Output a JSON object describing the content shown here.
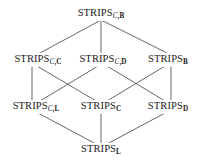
{
  "diagram": {
    "type": "hasse-diagram",
    "background_color": "#ffffff",
    "edge_color": "#555555",
    "text_color": "#1b1b1b",
    "nodes": [
      {
        "id": "c-b",
        "label": "STRIPSC,B",
        "base": "STRIPS",
        "sub_italic": "C",
        "sub_rest": ",B",
        "x": 101,
        "y": 14
      },
      {
        "id": "c-c",
        "label": "STRIPSC,C",
        "base": "STRIPS",
        "sub_italic": "C",
        "sub_rest": ",C",
        "x": 38,
        "y": 60
      },
      {
        "id": "c-d",
        "label": "STRIPSC,D",
        "base": "STRIPS",
        "sub_italic": "C",
        "sub_rest": ",D",
        "x": 103,
        "y": 60
      },
      {
        "id": "b",
        "label": "STRIPSB",
        "base": "STRIPS",
        "sub_italic": "",
        "sub_rest": "B",
        "x": 168,
        "y": 60
      },
      {
        "id": "c-l",
        "label": "STRIPSC,L",
        "base": "STRIPS",
        "sub_italic": "C",
        "sub_rest": ",L",
        "x": 36,
        "y": 107
      },
      {
        "id": "c",
        "label": "STRIPSC",
        "base": "STRIPS",
        "sub_italic": "",
        "sub_rest": "C",
        "x": 101,
        "y": 107
      },
      {
        "id": "d",
        "label": "STRIPSD",
        "base": "STRIPS",
        "sub_italic": "",
        "sub_rest": "D",
        "x": 168,
        "y": 107
      },
      {
        "id": "l",
        "label": "STRIPSL",
        "base": "STRIPS",
        "sub_italic": "",
        "sub_rest": "L",
        "x": 101,
        "y": 150
      }
    ],
    "edges": [
      {
        "from": "c-b",
        "to": "c-c",
        "x1": 101,
        "y1": 20,
        "x2": 40,
        "y2": 53
      },
      {
        "from": "c-b",
        "to": "c-d",
        "x1": 101,
        "y1": 20,
        "x2": 101,
        "y2": 53
      },
      {
        "from": "c-b",
        "to": "b",
        "x1": 101,
        "y1": 20,
        "x2": 167,
        "y2": 53
      },
      {
        "from": "c-c",
        "to": "c-l",
        "x1": 32,
        "y1": 66,
        "x2": 32,
        "y2": 101
      },
      {
        "from": "c-c",
        "to": "c",
        "x1": 37,
        "y1": 66,
        "x2": 96,
        "y2": 101
      },
      {
        "from": "c-d",
        "to": "c-l",
        "x1": 98,
        "y1": 66,
        "x2": 40,
        "y2": 101
      },
      {
        "from": "c-d",
        "to": "d",
        "x1": 107,
        "y1": 66,
        "x2": 165,
        "y2": 101
      },
      {
        "from": "b",
        "to": "c",
        "x1": 165,
        "y1": 66,
        "x2": 107,
        "y2": 101
      },
      {
        "from": "b",
        "to": "d",
        "x1": 171,
        "y1": 66,
        "x2": 171,
        "y2": 101
      },
      {
        "from": "c-l",
        "to": "l",
        "x1": 38,
        "y1": 113,
        "x2": 96,
        "y2": 144
      },
      {
        "from": "c",
        "to": "l",
        "x1": 101,
        "y1": 113,
        "x2": 101,
        "y2": 144
      },
      {
        "from": "d",
        "to": "l",
        "x1": 165,
        "y1": 113,
        "x2": 107,
        "y2": 144
      }
    ]
  }
}
